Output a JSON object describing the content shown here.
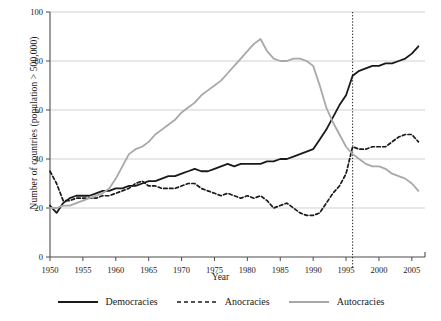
{
  "chart_data": {
    "type": "line",
    "title": "",
    "xlabel": "Year",
    "ylabel": "Number of countries (population > 500,000)",
    "xlim": [
      1950,
      2007
    ],
    "ylim": [
      0,
      100
    ],
    "xticks": [
      1950,
      1955,
      1960,
      1965,
      1970,
      1975,
      1980,
      1985,
      1990,
      1995,
      2000,
      2005
    ],
    "yticks": [
      0,
      20,
      40,
      60,
      80,
      100
    ],
    "grid": "horizontal",
    "legend_position": "bottom",
    "annotations": [
      {
        "type": "vline",
        "x": 1996,
        "style": "dotted",
        "color": "#1a1a1a"
      }
    ],
    "x": [
      1950,
      1951,
      1952,
      1953,
      1954,
      1955,
      1956,
      1957,
      1958,
      1959,
      1960,
      1961,
      1962,
      1963,
      1964,
      1965,
      1966,
      1967,
      1968,
      1969,
      1970,
      1971,
      1972,
      1973,
      1974,
      1975,
      1976,
      1977,
      1978,
      1979,
      1980,
      1981,
      1982,
      1983,
      1984,
      1985,
      1986,
      1987,
      1988,
      1989,
      1990,
      1991,
      1992,
      1993,
      1994,
      1995,
      1996,
      1997,
      1998,
      1999,
      2000,
      2001,
      2002,
      2003,
      2004,
      2005,
      2006
    ],
    "series": [
      {
        "name": "Democracies",
        "color": "#1a1a1a",
        "dash": "solid",
        "width": 1.8,
        "values": [
          21,
          18,
          22,
          24,
          25,
          25,
          25,
          26,
          27,
          27,
          28,
          28,
          29,
          29,
          30,
          31,
          31,
          32,
          33,
          33,
          34,
          35,
          36,
          35,
          35,
          36,
          37,
          38,
          37,
          38,
          38,
          38,
          38,
          39,
          39,
          40,
          40,
          41,
          42,
          43,
          44,
          48,
          52,
          57,
          62,
          66,
          74,
          76,
          77,
          78,
          78,
          79,
          79,
          80,
          81,
          83,
          86
        ]
      },
      {
        "name": "Anocracies",
        "color": "#1a1a1a",
        "dash": "dashed",
        "width": 1.7,
        "values": [
          35,
          30,
          23,
          23,
          24,
          24,
          24,
          24,
          25,
          25,
          26,
          27,
          28,
          30,
          31,
          29,
          29,
          28,
          28,
          28,
          29,
          30,
          30,
          28,
          27,
          26,
          25,
          26,
          25,
          24,
          25,
          24,
          25,
          23,
          20,
          21,
          22,
          20,
          18,
          17,
          17,
          18,
          22,
          26,
          29,
          34,
          45,
          44,
          44,
          45,
          45,
          45,
          47,
          49,
          50,
          50,
          47
        ]
      },
      {
        "name": "Autocracies",
        "color": "#a8a8a8",
        "dash": "solid",
        "width": 1.8,
        "values": [
          20,
          20,
          21,
          21,
          22,
          23,
          24,
          25,
          26,
          28,
          32,
          37,
          42,
          44,
          45,
          47,
          50,
          52,
          54,
          56,
          59,
          61,
          63,
          66,
          68,
          70,
          72,
          75,
          78,
          81,
          84,
          87,
          89,
          84,
          81,
          80,
          80,
          81,
          81,
          80,
          78,
          70,
          61,
          55,
          50,
          45,
          42,
          40,
          38,
          37,
          37,
          36,
          34,
          33,
          32,
          30,
          27
        ]
      }
    ]
  },
  "axis": {
    "x_tick_labels": [
      "1950",
      "1955",
      "1960",
      "1965",
      "1970",
      "1975",
      "1980",
      "1985",
      "1990",
      "1995",
      "2000",
      "2005"
    ],
    "y_tick_labels": [
      "0",
      "20",
      "40",
      "60",
      "80",
      "100"
    ],
    "x_title": "Year",
    "y_title": "Number of countries (population > 500,000)"
  },
  "legend": {
    "items": [
      {
        "label": "Democracies",
        "style": "solid",
        "color": "#1a1a1a"
      },
      {
        "label": "Anocracies",
        "style": "dashed",
        "color": "#1a1a1a"
      },
      {
        "label": "Autocracies",
        "style": "solid",
        "color": "#a8a8a8"
      }
    ]
  },
  "colors": {
    "democracies": "#1a1a1a",
    "anocracies": "#1a1a1a",
    "autocracies": "#a8a8a8",
    "grid": "#cccccc",
    "axis": "#4d4d4d",
    "background": "#ffffff"
  }
}
